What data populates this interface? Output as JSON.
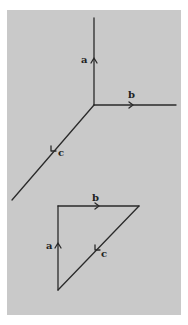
{
  "colors": {
    "background": "#ffffff",
    "panel": "#c9c9c9",
    "line": "#2a2a2a"
  },
  "top_figure": {
    "description": "Three vectors meeting at a common point",
    "vectors": [
      {
        "label": "a",
        "from": [
          94,
          105
        ],
        "to": [
          94,
          18
        ],
        "arrow_at": [
          94,
          60
        ],
        "direction": "up"
      },
      {
        "label": "b",
        "from": [
          94,
          105
        ],
        "to": [
          176,
          105
        ],
        "arrow_at": [
          131,
          105
        ],
        "direction": "right"
      },
      {
        "label": "c",
        "from": [
          94,
          105
        ],
        "to": [
          12,
          200
        ],
        "arrow_at": [
          53,
          151
        ],
        "direction": "down-left"
      }
    ]
  },
  "bottom_figure": {
    "description": "Vectors a, b, c arranged head-to-tail forming a closed triangle",
    "vectors": [
      {
        "label": "a",
        "from": [
          58,
          290
        ],
        "to": [
          58,
          206
        ],
        "arrow_at": [
          58,
          245
        ],
        "direction": "up"
      },
      {
        "label": "b",
        "from": [
          58,
          206
        ],
        "to": [
          139,
          206
        ],
        "arrow_at": [
          97,
          206
        ],
        "direction": "right"
      },
      {
        "label": "c",
        "from": [
          139,
          206
        ],
        "to": [
          58,
          290
        ],
        "arrow_at": [
          97,
          249
        ],
        "direction": "down-left"
      }
    ]
  },
  "labels": {
    "top_a": "a",
    "top_b": "b",
    "top_c": "c",
    "bottom_a": "a",
    "bottom_b": "b",
    "bottom_c": "c"
  }
}
